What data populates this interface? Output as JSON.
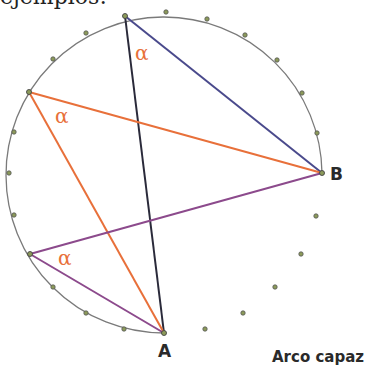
{
  "heading": "ejemplos:",
  "colors": {
    "circle": "#7a7a7a",
    "dot_fill": "#8c9a5a",
    "dot_stroke": "#555555",
    "black_line": "#2a2a3a",
    "blue_line": "#4a4a8c",
    "orange_line": "#e8703a",
    "purple_line": "#8c4a8c",
    "alpha_color": "#e8703a"
  },
  "points": {
    "A": {
      "label": "A",
      "x": 164,
      "y": 333
    },
    "B": {
      "label": "B",
      "x": 322,
      "y": 173
    },
    "P1": {
      "x": 125,
      "y": 16
    },
    "P2": {
      "x": 29,
      "y": 92
    },
    "P3": {
      "x": 30,
      "y": 254
    }
  },
  "angle_label": "α",
  "alpha_labels": [
    {
      "x": 135,
      "y": 60
    },
    {
      "x": 55,
      "y": 123
    },
    {
      "x": 58,
      "y": 265
    }
  ],
  "arc_dots": [
    [
      166,
      12
    ],
    [
      207,
      19
    ],
    [
      245,
      35
    ],
    [
      277,
      60
    ],
    [
      302,
      93
    ],
    [
      317,
      133
    ],
    [
      86,
      33
    ],
    [
      53,
      59
    ],
    [
      14,
      132
    ],
    [
      9,
      173
    ],
    [
      14,
      215
    ],
    [
      53,
      287
    ],
    [
      86,
      313
    ],
    [
      124,
      329
    ]
  ],
  "lower_dots": [
    [
      316,
      216
    ],
    [
      301,
      254
    ],
    [
      275,
      287
    ],
    [
      243,
      313
    ],
    [
      205,
      329
    ]
  ],
  "caption": "Arco capaz"
}
